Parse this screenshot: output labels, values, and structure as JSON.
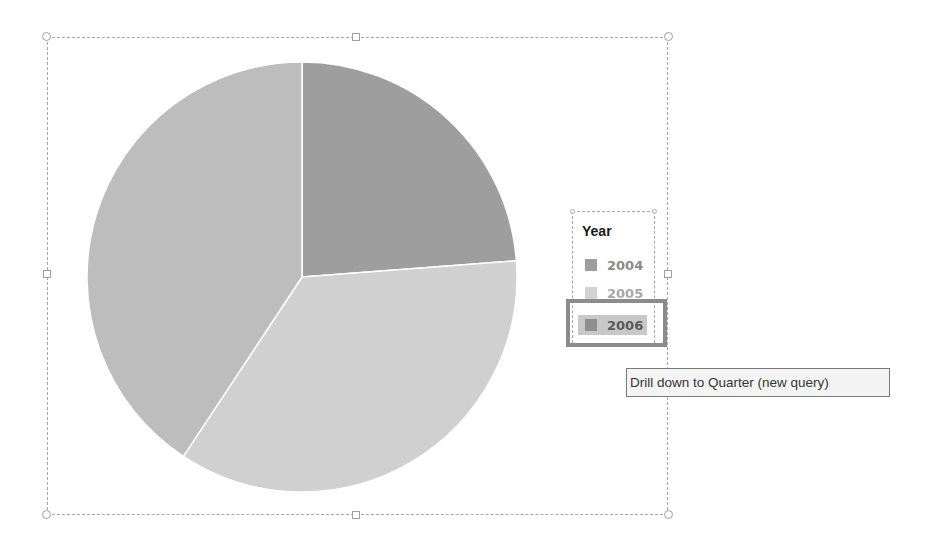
{
  "chart_data": {
    "type": "pie",
    "title": "",
    "legend_title": "Year",
    "legend_position": "right",
    "categories": [
      "2004",
      "2005",
      "2006"
    ],
    "values": [
      23.8,
      35.5,
      40.7
    ],
    "unit": "% (estimated from slice angles)",
    "colors": [
      "#9e9e9e",
      "#d0d0d0",
      "#bdbdbd"
    ],
    "start_angle": "12 o'clock, clockwise"
  },
  "legend": {
    "title": "Year",
    "items": [
      {
        "label": "2004",
        "color": "#9e9e9e"
      },
      {
        "label": "2005",
        "color": "#d0d0d0"
      },
      {
        "label": "2006",
        "color": "#8f8f8f"
      }
    ],
    "hovered_item": "2006"
  },
  "tooltip": {
    "text": "Drill down to Quarter (new query)"
  },
  "colors": {
    "frame": "#a8a8a8",
    "highlight": "#8c8c8c",
    "tooltip_bg": "#f4f4f4"
  }
}
